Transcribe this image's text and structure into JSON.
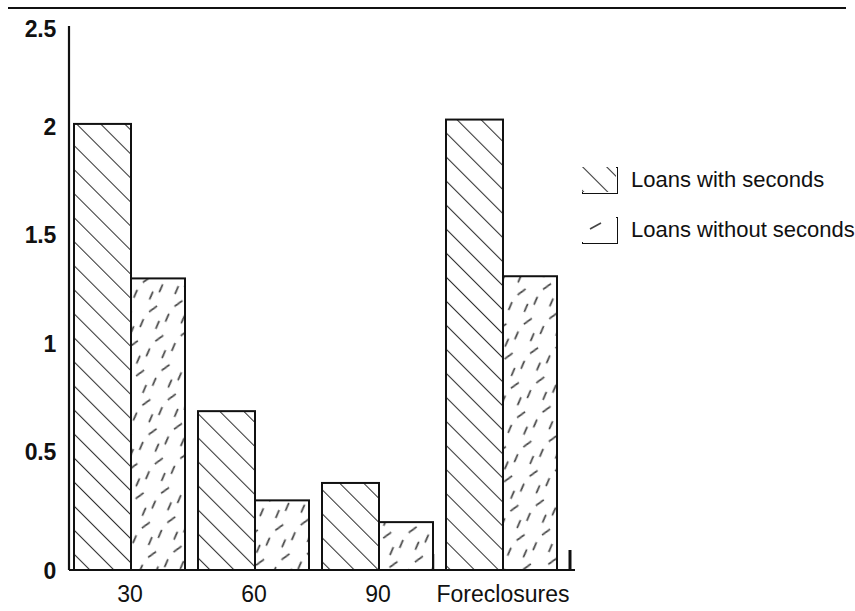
{
  "chart_data": {
    "type": "bar",
    "title": "",
    "subtitle": "",
    "xlabel": "",
    "ylabel": "",
    "categories": [
      "30",
      "60",
      "90",
      "Foreclosures"
    ],
    "series": [
      {
        "name": "Loans with seconds",
        "pattern": "dense-diagonal-hatch",
        "values": [
          2.05,
          0.73,
          0.4,
          2.07
        ]
      },
      {
        "name": "Loans without seconds",
        "pattern": "sparse-dashes",
        "values": [
          1.34,
          0.32,
          0.22,
          1.35
        ]
      }
    ],
    "ylim": [
      0,
      2.5
    ],
    "ytick_labels": [
      "0",
      "0.5",
      "1",
      "1.5",
      "2",
      "2.5"
    ],
    "ytick_values": [
      0,
      0.5,
      1,
      1.5,
      2,
      2.5
    ],
    "grid": false,
    "legend_position": "right"
  },
  "legend": {
    "entries": [
      {
        "label": "Loans with seconds"
      },
      {
        "label": "Loans without seconds"
      }
    ]
  },
  "axes": {
    "y_labels": [
      "2.5",
      "2",
      "1.5",
      "1",
      "0.5",
      "0"
    ],
    "x_labels": [
      "30",
      "60",
      "90",
      "Foreclosures"
    ]
  },
  "colors": {
    "ink": "#111111",
    "background": "#ffffff",
    "bar_fill": "#ffffff"
  }
}
